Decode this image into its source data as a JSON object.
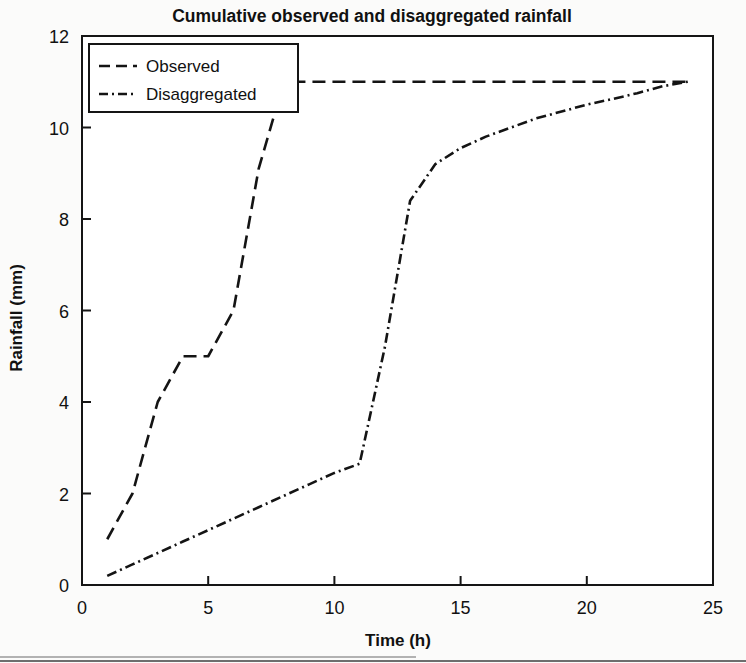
{
  "chart_data": {
    "type": "line",
    "title": "Cumulative observed and disaggregated rainfall",
    "xlabel": "Time (h)",
    "ylabel": "Rainfall (mm)",
    "xlim": [
      0,
      25
    ],
    "ylim": [
      0,
      12
    ],
    "xticks": [
      0,
      5,
      10,
      15,
      20,
      25
    ],
    "yticks": [
      0,
      2,
      4,
      6,
      8,
      10,
      12
    ],
    "xtick_labels": [
      "0",
      "5",
      "10",
      "15",
      "20",
      "25"
    ],
    "ytick_labels": [
      "0",
      "2",
      "4",
      "6",
      "8",
      "10",
      "12"
    ],
    "grid": false,
    "legend_position": "upper left",
    "series": [
      {
        "name": "Observed",
        "linestyle": "dashed",
        "color": "#141414",
        "x": [
          1,
          2,
          3,
          4,
          5,
          6,
          7,
          8,
          9,
          10,
          11,
          12,
          13,
          14,
          15,
          16,
          17,
          18,
          19,
          20,
          21,
          22,
          23,
          24
        ],
        "y": [
          1.0,
          2.0,
          4.0,
          5.0,
          5.0,
          6.0,
          9.1,
          11.0,
          11.0,
          11.0,
          11.0,
          11.0,
          11.0,
          11.0,
          11.0,
          11.0,
          11.0,
          11.0,
          11.0,
          11.0,
          11.0,
          11.0,
          11.0,
          11.0
        ]
      },
      {
        "name": "Disaggregated",
        "linestyle": "dashdot",
        "color": "#141414",
        "x": [
          1,
          2,
          3,
          4,
          5,
          6,
          7,
          8,
          9,
          10,
          11,
          12,
          13,
          14,
          15,
          16,
          17,
          18,
          19,
          20,
          21,
          22,
          23,
          24
        ],
        "y": [
          0.2,
          0.45,
          0.7,
          0.95,
          1.2,
          1.45,
          1.7,
          1.95,
          2.2,
          2.45,
          2.65,
          5.2,
          8.4,
          9.2,
          9.55,
          9.8,
          10.0,
          10.2,
          10.35,
          10.5,
          10.62,
          10.75,
          10.9,
          11.0
        ]
      }
    ],
    "legend_entries": [
      "Observed",
      "Disaggregated"
    ],
    "annotations": []
  },
  "legend": {
    "items": [
      {
        "label": "Observed"
      },
      {
        "label": "Disaggregated"
      }
    ]
  }
}
